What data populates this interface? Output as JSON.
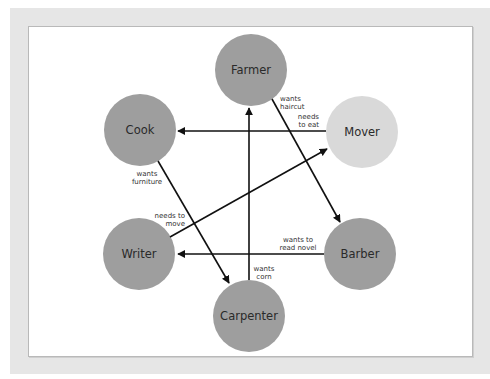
{
  "colors": {
    "frame": "#e6e6e6",
    "panel": "#ffffff",
    "node_dark": "#9e9e9e",
    "node_light": "#dadada",
    "edge": "#111111"
  },
  "nodes": [
    {
      "id": "farmer",
      "label": "Farmer",
      "cx": 251,
      "cy": 70,
      "r": 36,
      "fill": "#9e9e9e"
    },
    {
      "id": "cook",
      "label": "Cook",
      "cx": 140,
      "cy": 130,
      "r": 36,
      "fill": "#9e9e9e"
    },
    {
      "id": "mover",
      "label": "Mover",
      "cx": 362,
      "cy": 132,
      "r": 36,
      "fill": "#d9d9d9"
    },
    {
      "id": "writer",
      "label": "Writer",
      "cx": 139,
      "cy": 254,
      "r": 36,
      "fill": "#9e9e9e"
    },
    {
      "id": "barber",
      "label": "Barber",
      "cx": 360,
      "cy": 254,
      "r": 36,
      "fill": "#9e9e9e"
    },
    {
      "id": "carpenter",
      "label": "Carpenter",
      "cx": 249,
      "cy": 316,
      "r": 36,
      "fill": "#9e9e9e"
    }
  ],
  "edges": [
    {
      "from": "farmer",
      "to": "barber",
      "label": [
        "wants",
        "haircut"
      ]
    },
    {
      "from": "mover",
      "to": "cook",
      "label": [
        "needs",
        "to eat"
      ]
    },
    {
      "from": "cook",
      "to": "carpenter",
      "label": [
        "wants",
        "furniture"
      ]
    },
    {
      "from": "writer",
      "to": "mover",
      "label": [
        "needs to",
        "move"
      ]
    },
    {
      "from": "barber",
      "to": "writer",
      "label": [
        "wants to",
        "read novel"
      ]
    },
    {
      "from": "carpenter",
      "to": "farmer",
      "label": [
        "wants",
        "corn"
      ]
    }
  ],
  "labels": {
    "farmer": "Farmer",
    "cook": "Cook",
    "mover": "Mover",
    "writer": "Writer",
    "barber": "Barber",
    "carpenter": "Carpenter",
    "e1a": "wants",
    "e1b": "haircut",
    "e2a": "needs",
    "e2b": "to eat",
    "e3a": "wants",
    "e3b": "furniture",
    "e4a": "needs to",
    "e4b": "move",
    "e5a": "wants to",
    "e5b": "read novel",
    "e6a": "wants",
    "e6b": "corn"
  }
}
